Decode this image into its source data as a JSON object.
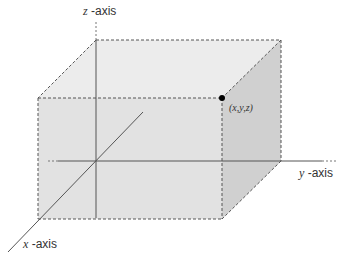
{
  "diagram": {
    "title": "",
    "axes": {
      "z": {
        "var": "z",
        "suffix": " -axis"
      },
      "y": {
        "var": "y",
        "suffix": " -axis"
      },
      "x": {
        "var": "x",
        "suffix": " -axis"
      }
    },
    "point": {
      "label": "(x,y,z)"
    },
    "colors": {
      "top_face": "#ececec",
      "front_face": "#e0e0e0",
      "side_face": "#cfcfcf",
      "edge": "#555555",
      "axis": "#555555",
      "point": "#000000"
    }
  }
}
